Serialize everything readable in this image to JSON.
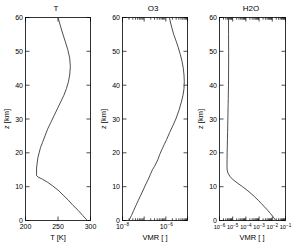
{
  "figure": {
    "background": "#ffffff",
    "curve_color": "#3a3a3a",
    "axis_color": "#000000",
    "panel_count": 3
  },
  "chart_data": [
    {
      "type": "line",
      "title": "T",
      "xlabel": "T [K]",
      "ylabel": "z [km]",
      "xscale": "linear",
      "yscale": "linear",
      "xlim": [
        200,
        300
      ],
      "ylim": [
        0,
        60
      ],
      "xticks": [
        200,
        250,
        300
      ],
      "xticklabels": [
        "200",
        "250",
        "300"
      ],
      "yticks": [
        0,
        10,
        20,
        30,
        40,
        50,
        60
      ],
      "yticklabels": [
        "0",
        "10",
        "20",
        "30",
        "40",
        "50",
        "60"
      ],
      "grid": false,
      "legend": "none",
      "series": [
        {
          "name": "temperature",
          "x": [
            295,
            288,
            281,
            273,
            266,
            258,
            250,
            242,
            234,
            226,
            219,
            217,
            217,
            217,
            218,
            219,
            221,
            223,
            226,
            230,
            234,
            239,
            244,
            249,
            254,
            259,
            263,
            266,
            268,
            269,
            268,
            265,
            261,
            256,
            250
          ],
          "y": [
            0,
            1.5,
            3,
            4.5,
            6,
            7.5,
            9,
            10.2,
            11.3,
            12.2,
            12.9,
            13.3,
            14,
            15.5,
            17,
            18.5,
            20,
            21.5,
            23,
            25,
            27,
            29,
            31,
            33,
            35,
            37,
            39,
            41,
            43,
            45.5,
            48,
            50.5,
            53,
            56,
            60
          ]
        }
      ]
    },
    {
      "type": "line",
      "title": "O3",
      "xlabel": "VMR [ ]",
      "ylabel": "z [km]",
      "xscale": "log",
      "yscale": "linear",
      "xlim": [
        1e-08,
        1e-05
      ],
      "ylim": [
        0,
        60
      ],
      "xticks": [
        1e-08,
        1e-06
      ],
      "xticklabels": [
        "10^-8",
        "10^-6"
      ],
      "yticks": [
        0,
        10,
        20,
        30,
        40,
        50,
        60
      ],
      "yticklabels": [
        "0",
        "10",
        "20",
        "30",
        "40",
        "50",
        "60"
      ],
      "grid": false,
      "legend": "none",
      "series": [
        {
          "name": "ozone-vmr",
          "x": [
            2e-08,
            2.6e-08,
            3.3e-08,
            4.2e-08,
            5.4e-08,
            7e-08,
            9e-08,
            1.15e-07,
            1.5e-07,
            1.9e-07,
            2.4e-07,
            3e-07,
            3.6e-07,
            4.3e-07,
            5.2e-07,
            6.6e-07,
            8.5e-07,
            1.1e-06,
            1.5e-06,
            2.1e-06,
            2.9e-06,
            4e-06,
            5.2e-06,
            6.2e-06,
            6.9e-06,
            7.1e-06,
            6.9e-06,
            6.4e-06,
            5.6e-06,
            4.7e-06,
            3.8e-06,
            3e-06,
            2.3e-06,
            1.8e-06,
            1.45e-06
          ],
          "y": [
            0,
            1.5,
            3,
            4.5,
            6,
            7.5,
            9,
            10.5,
            12,
            13.5,
            15,
            16,
            17,
            18,
            19.5,
            21,
            22.5,
            24,
            26,
            28,
            30,
            32.5,
            35,
            37,
            39,
            41,
            43,
            45,
            47,
            49,
            51,
            53,
            55,
            57.5,
            60
          ]
        }
      ]
    },
    {
      "type": "line",
      "title": "H2O",
      "xlabel": "VMR [ ]",
      "ylabel": "z [km]",
      "xscale": "log",
      "yscale": "linear",
      "xlim": [
        1e-06,
        0.1
      ],
      "ylim": [
        0,
        60
      ],
      "xticks": [
        1e-06,
        1e-05,
        0.0001,
        0.001,
        0.01,
        0.1
      ],
      "xticklabels": [
        "10^-6",
        "10^-5",
        "10^-4",
        "10^-3",
        "10^-2",
        "10^-1"
      ],
      "yticks": [
        0,
        10,
        20,
        30,
        40,
        50,
        60
      ],
      "yticklabels": [
        "0",
        "10",
        "20",
        "30",
        "40",
        "50",
        "60"
      ],
      "grid": false,
      "legend": "none",
      "series": [
        {
          "name": "water-vapour-vmr",
          "x": [
            0.018,
            0.012,
            0.0075,
            0.0045,
            0.0026,
            0.0015,
            0.00085,
            0.00046,
            0.00024,
            0.00012,
            5.5e-05,
            2.4e-05,
            1.1e-05,
            6.2e-06,
            4.4e-06,
            3.8e-06,
            3.7e-06,
            3.7e-06,
            3.75e-06,
            3.8e-06,
            3.9e-06,
            4e-06,
            4.1e-06,
            4.2e-06,
            4.3e-06,
            4.4e-06,
            4.5e-06,
            4.6e-06,
            4.7e-06,
            4.8e-06,
            4.85e-06,
            4.9e-06,
            4.9e-06,
            4.85e-06,
            4.8e-06
          ],
          "y": [
            0,
            1,
            2,
            3,
            4,
            5,
            6,
            7,
            8,
            9,
            10,
            11,
            12,
            13,
            14,
            15,
            16,
            17,
            18,
            20,
            22,
            24,
            26,
            28,
            30,
            32,
            34,
            36,
            38,
            40,
            43,
            46,
            50,
            55,
            60
          ]
        }
      ]
    }
  ]
}
